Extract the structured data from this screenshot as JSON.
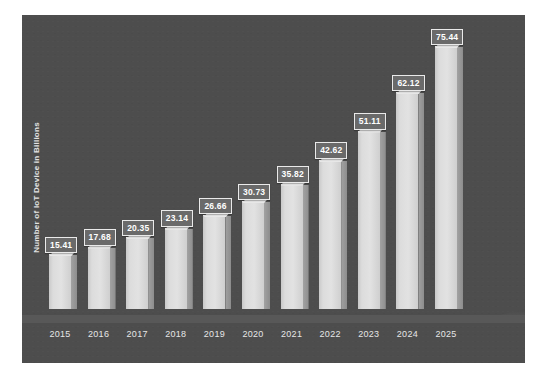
{
  "chart_data": {
    "type": "bar",
    "title": "",
    "subtitle": "",
    "xlabel": "",
    "ylabel": "Number of IoT Device in Billions",
    "categories": [
      "2015",
      "2016",
      "2017",
      "2018",
      "2019",
      "2020",
      "2021",
      "2022",
      "2023",
      "2024",
      "2025"
    ],
    "values": [
      15.41,
      17.68,
      20.35,
      23.14,
      26.66,
      30.73,
      35.82,
      42.62,
      51.11,
      62.12,
      75.44
    ],
    "data_labels": [
      "15.41",
      "17.68",
      "20.35",
      "23.14",
      "26.66",
      "30.73",
      "35.82",
      "42.62",
      "51.11",
      "62.12",
      "75.44"
    ],
    "ylim": [
      0,
      75.44
    ],
    "grid": false,
    "legend": false,
    "legend_position": "none",
    "style_3d": true,
    "series": [
      {
        "name": "Number of IoT Device in Billions",
        "values": [
          15.41,
          17.68,
          20.35,
          23.14,
          26.66,
          30.73,
          35.82,
          42.62,
          51.11,
          62.12,
          75.44
        ]
      }
    ]
  },
  "colors": {
    "plot_background": "#4d4d4d",
    "bar_front": "#dcdcdc",
    "bar_side": "#949494",
    "bar_top": "#e7e7e7",
    "label_box_fill": "#6a6a6a",
    "label_box_border": "#eaeaea",
    "label_text": "#ffffff",
    "axis_text": "#e6e6e6",
    "page_background": "#ffffff",
    "floor": "#585858"
  }
}
